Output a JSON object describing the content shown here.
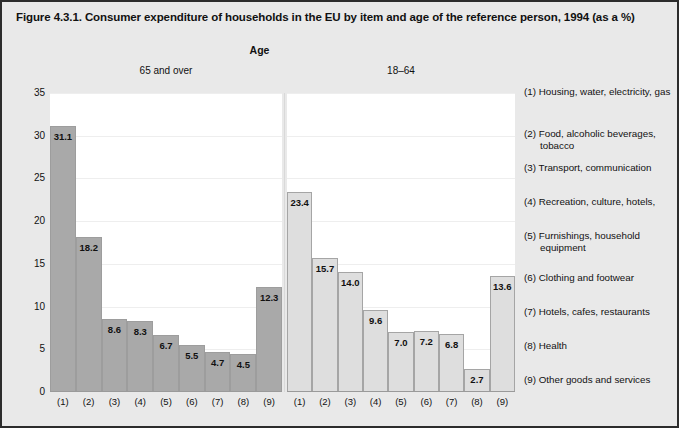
{
  "title": "Figure 4.3.1. Consumer expenditure of households in the EU by item and age of the reference person, 1994 (as a %)",
  "group_header": "Age",
  "panels": {
    "left_header": "65 and over",
    "right_header": "18–64"
  },
  "y_axis": {
    "ticks": [
      "0",
      "5",
      "10",
      "15",
      "20",
      "25",
      "30",
      "35"
    ]
  },
  "x_categories": [
    "(1)",
    "(2)",
    "(3)",
    "(4)",
    "(5)",
    "(6)",
    "(7)",
    "(8)",
    "(9)"
  ],
  "legend": {
    "items": [
      "(1) Housing, water, electricity, gas",
      "(2) Food, alcoholic beverages, tobacco",
      "(3) Transport, communication",
      "(4) Recreation, culture, hotels,",
      "(5) Furnishings, household equipment",
      "(6) Clothing and footwear",
      "(7) Hotels, cafes, restaurants",
      "(8) Health",
      "(9) Other goods and services"
    ]
  },
  "colors": {
    "bar_left": "#a9a9a9",
    "bar_right": "#dedede",
    "background": "#e9e9e9",
    "plot_background": "#ffffff",
    "border": "#2c2c2c"
  },
  "chart_data": {
    "type": "bar",
    "title": "Figure 4.3.1. Consumer expenditure of households in the EU by item and age of the reference person, 1994 (as a %)",
    "xlabel": "",
    "ylabel": "",
    "ylim": [
      0,
      35
    ],
    "ytick_step": 5,
    "grid": true,
    "legend_position": "right",
    "categories": [
      "(1)",
      "(2)",
      "(3)",
      "(4)",
      "(5)",
      "(6)",
      "(7)",
      "(8)",
      "(9)"
    ],
    "category_labels": [
      "(1) Housing, water, electricity, gas",
      "(2) Food, alcoholic beverages, tobacco",
      "(3) Transport, communication",
      "(4) Recreation, culture, hotels,",
      "(5) Furnishings, household equipment",
      "(6) Clothing and footwear",
      "(7) Hotels, cafes, restaurants",
      "(8) Health",
      "(9) Other goods and services"
    ],
    "panels": [
      {
        "name": "65 and over",
        "values": [
          31.1,
          18.2,
          8.6,
          8.3,
          6.7,
          5.5,
          4.7,
          4.5,
          12.3
        ],
        "value_labels": [
          "31.1",
          "18.2",
          "8.6",
          "8.3",
          "6.7",
          "5.5",
          "4.7",
          "4.5",
          "12.3"
        ]
      },
      {
        "name": "18–64",
        "values": [
          23.4,
          15.7,
          14.0,
          9.6,
          7.0,
          7.2,
          6.8,
          2.7,
          13.6
        ],
        "value_labels": [
          "23.4",
          "15.7",
          "14.0",
          "9.6",
          "7.0",
          "7.2",
          "6.8",
          "2.7",
          "13.6"
        ]
      }
    ]
  }
}
